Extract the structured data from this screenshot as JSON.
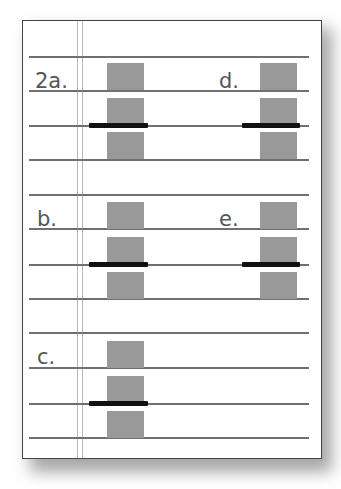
{
  "figure": {
    "type": "worksheet-diagram",
    "colors": {
      "block": "#999999",
      "bar": "#111111",
      "rule": "#707070",
      "label": "#555555"
    },
    "items": [
      {
        "label": "2a.",
        "column": "left",
        "row": 1
      },
      {
        "label": "d.",
        "column": "right",
        "row": 1
      },
      {
        "label": "b.",
        "column": "left",
        "row": 2
      },
      {
        "label": "e.",
        "column": "right",
        "row": 2
      },
      {
        "label": "c.",
        "column": "left",
        "row": 3
      }
    ]
  }
}
